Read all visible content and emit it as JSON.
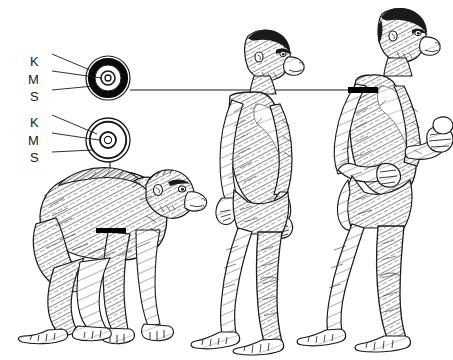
{
  "figure": {
    "kind": "scientific-illustration",
    "background_color": "#ffffff",
    "ink_color": "#1a1a1a",
    "width": 453,
    "height": 360
  },
  "cross_sections": [
    {
      "id": "upper",
      "name": "thick-cortex-cross-section",
      "center": {
        "x": 108,
        "y": 78
      },
      "outer_radius": 22,
      "cortex_outer_radius": 20,
      "cortex_inner_radius": 13,
      "cortex_thick": true,
      "medullary_radius": 7,
      "core_radius": 3,
      "connects_to": "right-figure-humerus",
      "labels": [
        {
          "text": "K",
          "x": 34,
          "y": 56,
          "tip_x": 96,
          "tip_y": 74,
          "leader": "angled"
        },
        {
          "text": "M",
          "x": 32,
          "y": 74,
          "tip_x": 101,
          "tip_y": 79,
          "leader": "horizontal"
        },
        {
          "text": "S",
          "x": 34,
          "y": 91,
          "tip_x": 92,
          "tip_y": 86,
          "leader": "angled"
        }
      ]
    },
    {
      "id": "lower",
      "name": "thin-cortex-cross-section",
      "center": {
        "x": 108,
        "y": 140
      },
      "outer_radius": 22,
      "cortex_outer_radius": 20,
      "cortex_inner_radius": 17,
      "cortex_thick": false,
      "medullary_radius": 8,
      "core_radius": 4,
      "connects_to": "left-figure-humerus",
      "labels": [
        {
          "text": "K",
          "x": 34,
          "y": 117,
          "tip_x": 96,
          "tip_y": 134,
          "leader": "angled"
        },
        {
          "text": "M",
          "x": 32,
          "y": 135,
          "tip_x": 100,
          "tip_y": 140,
          "leader": "horizontal"
        },
        {
          "text": "S",
          "x": 34,
          "y": 152,
          "tip_x": 92,
          "tip_y": 149,
          "leader": "angled"
        }
      ]
    }
  ],
  "leader_lines": [
    {
      "name": "upper-section-to-right-figure",
      "from_x": 130,
      "from_y": 90,
      "to_x": 350,
      "to_y": 90,
      "orientation": "horizontal"
    },
    {
      "name": "lower-section-to-left-figure",
      "from_x": 110,
      "from_y": 162,
      "to_x": 110,
      "to_y": 230,
      "orientation": "vertical"
    }
  ],
  "marker_bars": [
    {
      "name": "left-figure-humerus-bar",
      "x": 96,
      "y": 228,
      "width": 30,
      "height": 5
    },
    {
      "name": "right-figure-humerus-bar",
      "x": 348,
      "y": 87,
      "width": 30,
      "height": 6
    }
  ],
  "figures": [
    {
      "id": "left",
      "name": "knuckle-walking-ape",
      "posture": "quadrupedal knuckle-walking",
      "facing": "right",
      "ground_y": 336
    },
    {
      "id": "middle",
      "name": "early-hominid-bipedal",
      "posture": "upright bipedal walking, arms hanging",
      "facing": "right",
      "ground_y": 346
    },
    {
      "id": "right",
      "name": "later-hominid-bipedal",
      "posture": "upright bipedal striding, arms flexed holding object",
      "facing": "right",
      "ground_y": 340
    }
  ]
}
